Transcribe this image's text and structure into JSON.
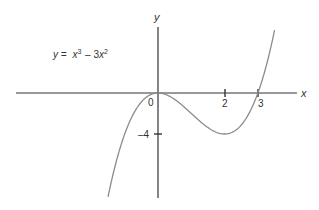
{
  "equation": {
    "lhs": "y =",
    "x_term": "x",
    "x_exp": "3",
    "minus": "– 3",
    "x2_term": "x",
    "x2_exp": "2"
  },
  "axes": {
    "x_label": "x",
    "y_label": "y",
    "origin_label": "0",
    "x_ticks": [
      {
        "value": 2,
        "label": "2"
      },
      {
        "value": 3,
        "label": "3"
      }
    ],
    "y_ticks": [
      {
        "value": -4,
        "label": "–4"
      }
    ]
  },
  "colors": {
    "axis": "#333333",
    "curve": "#8c8c8c",
    "text": "#333333"
  },
  "chart_data": {
    "type": "line",
    "xlabel": "x",
    "ylabel": "y",
    "function": "x^3 - 3x^2",
    "x_range": [
      -1.5,
      3.5
    ],
    "key_points": [
      {
        "x": 0,
        "y": 0,
        "note": "local max / root"
      },
      {
        "x": 2,
        "y": -4,
        "note": "local min"
      },
      {
        "x": 3,
        "y": 0,
        "note": "root"
      }
    ],
    "x_ticks": [
      2,
      3
    ],
    "y_ticks": [
      -4
    ],
    "grid": false,
    "legend": "none"
  }
}
